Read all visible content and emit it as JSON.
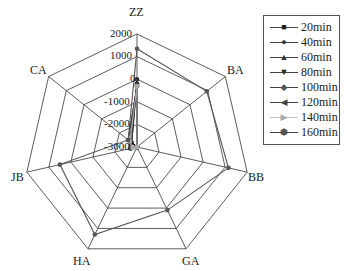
{
  "chart_data": {
    "type": "radar",
    "title": "",
    "axes": [
      "ZZ",
      "BA",
      "BB",
      "GA",
      "HA",
      "JB",
      "CA"
    ],
    "radial_ticks": [
      "2000",
      "1000",
      "0",
      "-1000",
      "-2000",
      "-3000"
    ],
    "rlim": [
      -3000,
      2000
    ],
    "legend_position": "right",
    "series": [
      {
        "name": "20min",
        "marker": "square",
        "color": "#222222",
        "values": [
          -200,
          -3000,
          -3000,
          -3000,
          -3000,
          -3000,
          -2700
        ]
      },
      {
        "name": "40min",
        "marker": "circle",
        "color": "#333333",
        "values": [
          0,
          -3000,
          -3000,
          -3000,
          -3000,
          -3000,
          -2700
        ]
      },
      {
        "name": "60min",
        "marker": "triangle-up",
        "color": "#333333",
        "values": [
          -200,
          -3000,
          -3000,
          -3000,
          -3000,
          -3000,
          -2600
        ]
      },
      {
        "name": "80min",
        "marker": "triangle-down",
        "color": "#222222",
        "values": [
          -300,
          -3000,
          -3000,
          -3000,
          -3000,
          -3000,
          -2500
        ]
      },
      {
        "name": "100min",
        "marker": "diamond",
        "color": "#555555",
        "values": [
          -300,
          -3000,
          -3000,
          -3000,
          -3000,
          -2700,
          -2600
        ]
      },
      {
        "name": "120min",
        "marker": "triangle-left",
        "color": "#444444",
        "values": [
          -300,
          -3000,
          -3000,
          -3000,
          -3000,
          -2700,
          -2500
        ]
      },
      {
        "name": "140min",
        "marker": "triangle-right",
        "color": "#aaaaaa",
        "values": [
          -300,
          -3000,
          -3000,
          -3000,
          -3000,
          -2800,
          -2600
        ]
      },
      {
        "name": "160min",
        "marker": "hexagon",
        "color": "#555555",
        "values": [
          1350,
          950,
          1150,
          100,
          1300,
          500,
          -2500
        ]
      }
    ]
  },
  "labels": {
    "axes": [
      "ZZ",
      "BA",
      "BB",
      "GA",
      "HA",
      "JB",
      "CA"
    ],
    "ticks": [
      "2000",
      "1000",
      "0",
      "-1000",
      "-2000",
      "-3000"
    ]
  },
  "legend": {
    "items": [
      {
        "label": "20min",
        "glyph": "■",
        "color": "#222222"
      },
      {
        "label": "40min",
        "glyph": "●",
        "color": "#333333"
      },
      {
        "label": "60min",
        "glyph": "▲",
        "color": "#333333"
      },
      {
        "label": "80min",
        "glyph": "▼",
        "color": "#222222"
      },
      {
        "label": "100min",
        "glyph": "◆",
        "color": "#555555"
      },
      {
        "label": "120min",
        "glyph": "◀",
        "color": "#444444"
      },
      {
        "label": "140min",
        "glyph": "▶",
        "color": "#aaaaaa"
      },
      {
        "label": "160min",
        "glyph": "⬢",
        "color": "#555555"
      }
    ]
  }
}
